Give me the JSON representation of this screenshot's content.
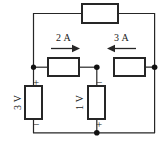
{
  "figure": {
    "name": "resistive-circuit-schematic",
    "type": "electrical-circuit-diagram",
    "width": 165,
    "height": 146,
    "background_color": "#ffffff",
    "line_color": "#262626"
  },
  "elements": {
    "top_resistor": {
      "name": "top-branch-resistor",
      "label": ""
    },
    "left_middle_resistor": {
      "name": "left-middle-resistor",
      "label": ""
    },
    "right_middle_resistor": {
      "name": "right-middle-resistor",
      "label": ""
    },
    "left_source": {
      "name": "left-voltage-source",
      "value": "3 V",
      "plus": "+",
      "minus": "−"
    },
    "middle_source": {
      "name": "middle-voltage-source",
      "value": "1 V",
      "plus": "+",
      "minus": "−"
    }
  },
  "currents": [
    {
      "name": "current-left-branch",
      "label": "2 A",
      "direction": "right"
    },
    {
      "name": "current-right-branch",
      "label": "3 A",
      "direction": "left"
    }
  ],
  "nodes": [
    {
      "name": "node-left-middle"
    },
    {
      "name": "node-center-middle"
    },
    {
      "name": "node-right-middle"
    },
    {
      "name": "node-bottom-center"
    }
  ]
}
